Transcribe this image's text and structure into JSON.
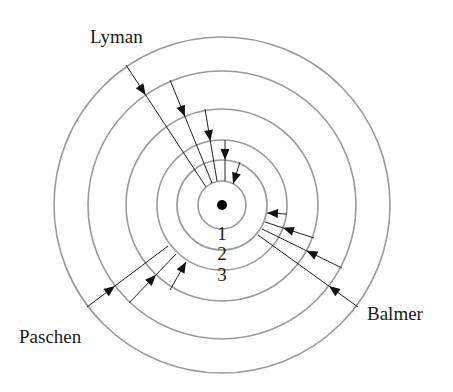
{
  "diagram": {
    "center": {
      "x": 222,
      "y": 205
    },
    "nucleus_radius": 5,
    "orbits": [
      {
        "n": 1,
        "r": 24
      },
      {
        "n": 2,
        "r": 45
      },
      {
        "n": 3,
        "r": 65
      },
      {
        "n": 4,
        "r": 96
      },
      {
        "n": 5,
        "r": 134
      },
      {
        "n": 6,
        "r": 168
      }
    ],
    "level_labels": [
      {
        "text": "1",
        "x": 222,
        "y": 240
      },
      {
        "text": "2",
        "x": 222,
        "y": 260
      },
      {
        "text": "3",
        "x": 222,
        "y": 281
      }
    ],
    "series": [
      {
        "name": "Lyman",
        "label": {
          "text": "Lyman",
          "x": 90,
          "y": 43
        },
        "transitions": [
          {
            "from": 6,
            "to": 1,
            "x1": 126,
            "y1": 65,
            "x2": 206,
            "y2": 187
          },
          {
            "from": 5,
            "to": 1,
            "x1": 170,
            "y1": 80,
            "x2": 212,
            "y2": 183
          },
          {
            "from": 4,
            "to": 1,
            "x1": 205,
            "y1": 109,
            "x2": 217,
            "y2": 181
          },
          {
            "from": 3,
            "to": 1,
            "x1": 225,
            "y1": 140,
            "x2": 225,
            "y2": 181
          },
          {
            "from": 2,
            "to": 1,
            "x1": 240,
            "y1": 162,
            "x2": 233,
            "y2": 184
          }
        ]
      },
      {
        "name": "Balmer",
        "label": {
          "text": "Balmer",
          "x": 367,
          "y": 320
        },
        "transitions": [
          {
            "from": 3,
            "to": 2,
            "x1": 287,
            "y1": 214,
            "x2": 267,
            "y2": 213
          },
          {
            "from": 4,
            "to": 2,
            "x1": 314,
            "y1": 238,
            "x2": 265,
            "y2": 222
          },
          {
            "from": 5,
            "to": 2,
            "x1": 342,
            "y1": 268,
            "x2": 262,
            "y2": 229
          },
          {
            "from": 6,
            "to": 2,
            "x1": 358,
            "y1": 307,
            "x2": 258,
            "y2": 235
          }
        ]
      },
      {
        "name": "Paschen",
        "label": {
          "text": "Paschen",
          "x": 19,
          "y": 343
        },
        "transitions": [
          {
            "from": 6,
            "to": 3,
            "x1": 87,
            "y1": 307,
            "x2": 168,
            "y2": 246
          },
          {
            "from": 5,
            "to": 3,
            "x1": 129,
            "y1": 303,
            "x2": 176,
            "y2": 254
          },
          {
            "from": 4,
            "to": 3,
            "x1": 170,
            "y1": 290,
            "x2": 186,
            "y2": 262
          }
        ]
      }
    ],
    "colors": {
      "orbit": "#9a9a9a",
      "transition": "#222222",
      "nucleus": "#000000",
      "text": "#1a1a1a"
    }
  }
}
